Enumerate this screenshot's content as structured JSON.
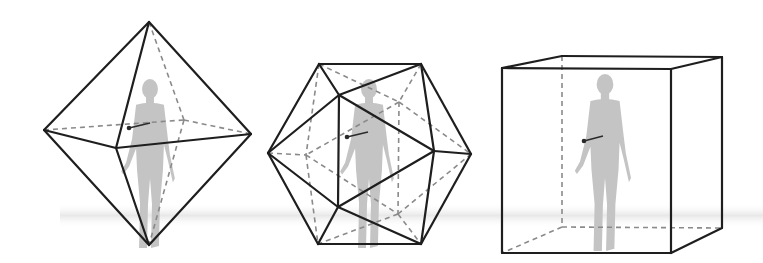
{
  "diagram": {
    "title": "",
    "colors": {
      "background": "#ffffff",
      "solid_edge": "#1e1e1e",
      "hidden_edge": "#8a8a8a",
      "figure": "#c4c4c4",
      "ground": "#ececec"
    },
    "ground_band": {
      "y_top": 203,
      "y_bottom": 228
    },
    "panels": [
      {
        "id": "octahedron",
        "shape": "octahedron",
        "label": "",
        "vertices": {
          "top": [
            149,
            22
          ],
          "left": [
            44,
            130
          ],
          "front": [
            116,
            148
          ],
          "right": [
            251,
            134
          ],
          "back": [
            184,
            120
          ],
          "bottom": [
            149,
            245
          ]
        },
        "solid_edges": [
          [
            "top",
            "left"
          ],
          [
            "top",
            "front"
          ],
          [
            "top",
            "right"
          ],
          [
            "left",
            "front"
          ],
          [
            "front",
            "right"
          ],
          [
            "left",
            "bottom"
          ],
          [
            "front",
            "bottom"
          ],
          [
            "right",
            "bottom"
          ]
        ],
        "hidden_edges": [
          [
            "top",
            "back"
          ],
          [
            "left",
            "back"
          ],
          [
            "back",
            "right"
          ],
          [
            "back",
            "bottom"
          ]
        ],
        "figure": {
          "x": 150,
          "head_y": 79,
          "feet_y": 250,
          "scale": 1.0
        },
        "pointer": {
          "from": [
            150,
            123
          ],
          "to": [
            129,
            128
          ]
        }
      },
      {
        "id": "icosahedron",
        "shape": "icosahedron",
        "label": "",
        "vertices": {
          "T1": [
            319,
            64
          ],
          "T2": [
            421,
            64
          ],
          "L": [
            268,
            153
          ],
          "R": [
            471,
            154
          ],
          "B1": [
            318,
            244
          ],
          "B2": [
            421,
            244
          ],
          "F1": [
            339,
            95
          ],
          "F2": [
            338,
            207
          ],
          "F3": [
            434,
            151
          ],
          "H1": [
            399,
            102
          ],
          "H2": [
            398,
            214
          ],
          "H3": [
            306,
            155
          ]
        },
        "solid_edges": [
          [
            "T1",
            "T2"
          ],
          [
            "T1",
            "L"
          ],
          [
            "T1",
            "F1"
          ],
          [
            "T2",
            "F1"
          ],
          [
            "T2",
            "R"
          ],
          [
            "T2",
            "F3"
          ],
          [
            "F1",
            "L"
          ],
          [
            "F1",
            "F3"
          ],
          [
            "F1",
            "F2"
          ],
          [
            "L",
            "F2"
          ],
          [
            "L",
            "B1"
          ],
          [
            "F2",
            "F3"
          ],
          [
            "F2",
            "B1"
          ],
          [
            "F2",
            "B2"
          ],
          [
            "F3",
            "R"
          ],
          [
            "F3",
            "B2"
          ],
          [
            "R",
            "B2"
          ],
          [
            "B1",
            "B2"
          ]
        ],
        "hidden_edges": [
          [
            "T1",
            "H1"
          ],
          [
            "T2",
            "H1"
          ],
          [
            "H1",
            "H3"
          ],
          [
            "H1",
            "R"
          ],
          [
            "H1",
            "H2"
          ],
          [
            "T1",
            "H3"
          ],
          [
            "L",
            "H3"
          ],
          [
            "H3",
            "B1"
          ],
          [
            "H3",
            "H2"
          ],
          [
            "H2",
            "B1"
          ],
          [
            "H2",
            "B2"
          ],
          [
            "H2",
            "R"
          ]
        ],
        "figure": {
          "x": 369,
          "head_y": 79,
          "feet_y": 250,
          "scale": 1.0
        },
        "pointer": {
          "from": [
            368,
            132
          ],
          "to": [
            347,
            137
          ]
        }
      },
      {
        "id": "cube",
        "shape": "cube",
        "label": "",
        "vertices": {
          "ftl": [
            502,
            68
          ],
          "ftr": [
            671,
            69
          ],
          "fbl": [
            502,
            253
          ],
          "fbr": [
            671,
            253
          ],
          "btl": [
            562,
            56
          ],
          "btr": [
            722,
            57
          ],
          "bbl": [
            562,
            227
          ],
          "bbr": [
            722,
            228
          ]
        },
        "solid_edges": [
          [
            "ftl",
            "ftr"
          ],
          [
            "ftr",
            "fbr"
          ],
          [
            "fbr",
            "fbl"
          ],
          [
            "fbl",
            "ftl"
          ],
          [
            "ftl",
            "btl"
          ],
          [
            "btl",
            "btr"
          ],
          [
            "btr",
            "ftr"
          ],
          [
            "btr",
            "bbr"
          ],
          [
            "bbr",
            "fbr"
          ]
        ],
        "hidden_edges": [
          [
            "btl",
            "bbl"
          ],
          [
            "bbl",
            "bbr"
          ],
          [
            "bbl",
            "fbl"
          ]
        ],
        "figure": {
          "x": 605,
          "head_y": 74,
          "feet_y": 253,
          "scale": 1.05
        },
        "pointer": {
          "from": [
            603,
            136
          ],
          "to": [
            584,
            141
          ]
        }
      }
    ]
  }
}
